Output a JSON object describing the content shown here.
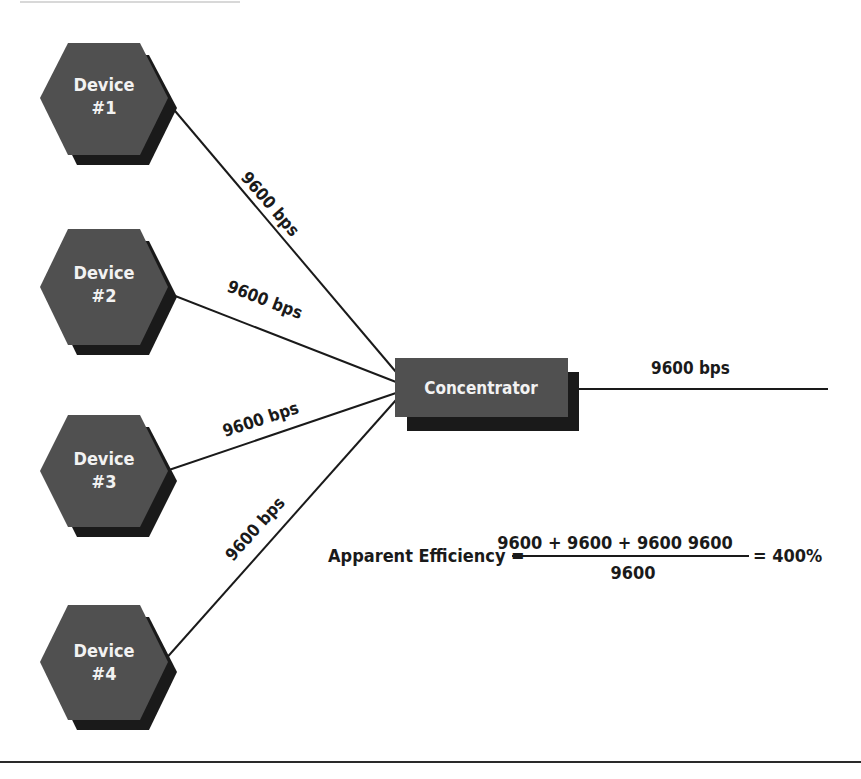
{
  "diagram": {
    "devices": [
      {
        "line1": "Device",
        "line2": "#1"
      },
      {
        "line1": "Device",
        "line2": "#2"
      },
      {
        "line1": "Device",
        "line2": "#3"
      },
      {
        "line1": "Device",
        "line2": "#4"
      }
    ],
    "links": [
      {
        "label": "9600 bps"
      },
      {
        "label": "9600 bps"
      },
      {
        "label": "9600 bps"
      },
      {
        "label": "9600 bps"
      }
    ],
    "concentrator": {
      "label": "Concentrator"
    },
    "output_link": {
      "label": "9600 bps"
    },
    "equation": {
      "lhs": "Apparent Efficiency =",
      "numerator": "9600 + 9600 + 9600  9600",
      "denominator": "9600",
      "result": "= 400%"
    },
    "colors": {
      "node_face": "#505050",
      "node_shadow": "#1a1a1a",
      "line": "#1a1a1a",
      "node_text": "#f2f2f2"
    }
  }
}
